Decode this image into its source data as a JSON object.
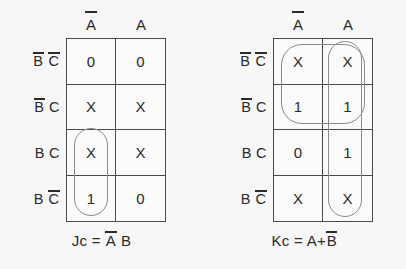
{
  "figure": {
    "background_color": "#f7f7f8",
    "line_color": "#4a4a4a",
    "oval_color": "#8a8a8a",
    "text_color": "#2b2b2b"
  },
  "kmaps": [
    {
      "id": "jc",
      "caption": "Jc = Ā B",
      "caption_parts": {
        "lhs": "Jc",
        "eq": "=",
        "var1": "A",
        "var1_bar": true,
        "var2": "B",
        "var2_bar": false
      },
      "columns": [
        {
          "label": "A",
          "overbar": true
        },
        {
          "label": "A",
          "overbar": false
        }
      ],
      "rows": [
        {
          "v1": "B",
          "v1_bar": true,
          "v2": "C",
          "v2_bar": true
        },
        {
          "v1": "B",
          "v1_bar": true,
          "v2": "C",
          "v2_bar": false
        },
        {
          "v1": "B",
          "v1_bar": false,
          "v2": "C",
          "v2_bar": false
        },
        {
          "v1": "B",
          "v1_bar": false,
          "v2": "C",
          "v2_bar": true
        }
      ],
      "cells": [
        [
          "0",
          "0"
        ],
        [
          "X",
          "X"
        ],
        [
          "X",
          "X"
        ],
        [
          "1",
          "0"
        ]
      ],
      "groups": [
        {
          "name": "group-abar-bc",
          "col_start": 0,
          "col_span": 1,
          "row_start": 2,
          "row_span": 2
        }
      ]
    },
    {
      "id": "kc",
      "caption": "Kc = A+B̄",
      "caption_parts": {
        "lhs": "Kc",
        "eq": "=",
        "var1": "A",
        "var1_bar": false,
        "op": "+",
        "var2": "B",
        "var2_bar": true
      },
      "columns": [
        {
          "label": "A",
          "overbar": true
        },
        {
          "label": "A",
          "overbar": false
        }
      ],
      "rows": [
        {
          "v1": "B",
          "v1_bar": true,
          "v2": "C",
          "v2_bar": true
        },
        {
          "v1": "B",
          "v1_bar": true,
          "v2": "C",
          "v2_bar": false
        },
        {
          "v1": "B",
          "v1_bar": false,
          "v2": "C",
          "v2_bar": false
        },
        {
          "v1": "B",
          "v1_bar": false,
          "v2": "C",
          "v2_bar": true
        }
      ],
      "cells": [
        [
          "X",
          "X"
        ],
        [
          "1",
          "1"
        ],
        [
          "0",
          "1"
        ],
        [
          "X",
          "X"
        ]
      ],
      "groups": [
        {
          "name": "group-bbar",
          "col_start": 0,
          "col_span": 2,
          "row_start": 0,
          "row_span": 2
        },
        {
          "name": "group-a",
          "col_start": 1,
          "col_span": 1,
          "row_start": 0,
          "row_span": 4
        }
      ]
    }
  ]
}
